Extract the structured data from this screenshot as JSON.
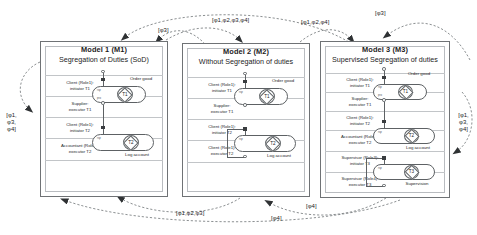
{
  "diagram": {
    "arrow_color": "#2f3234",
    "box_border_color": "#6f7275"
  },
  "models": [
    {
      "id": "M1",
      "title": "Model 1 (M1)",
      "subtitle": "Segregation of Duties (SoD)",
      "bands": [
        {
          "role": "Client (Role1):",
          "line2": "initiator T1"
        },
        {
          "role": "Supplier:",
          "line2": "executor T1"
        },
        {
          "role": "Client (Role1):",
          "line2": "initiator T2"
        },
        {
          "role": "Accountant (Role2):",
          "line2": "executor T2"
        }
      ],
      "transactions": [
        {
          "id": "T1",
          "label": "Order good"
        },
        {
          "id": "T2",
          "label": "Log account"
        }
      ]
    },
    {
      "id": "M2",
      "title": "Model 2 (M2)",
      "subtitle": "Without Segregation of duties",
      "bands": [
        {
          "role": "Client (Role1):",
          "line2": "initiator T1"
        },
        {
          "role": "Supplier:",
          "line2": "executor T1"
        },
        {
          "role": "Client (Role1):",
          "line2": "initiator T2"
        },
        {
          "role": "Client (Role1):",
          "line2": "executor T2"
        }
      ],
      "transactions": [
        {
          "id": "T1",
          "label": "Order good"
        },
        {
          "id": "T2",
          "label": "Log account"
        }
      ]
    },
    {
      "id": "M3",
      "title": "Model 3 (M3)",
      "subtitle": "Supervised Segregation of duties",
      "bands": [
        {
          "role": "Client (Role1):",
          "line2": "initiator T1"
        },
        {
          "role": "Supplier:",
          "line2": "executor T1"
        },
        {
          "role": "Client (Role1):",
          "line2": "initiator T2"
        },
        {
          "role": "Accountant (Role2):",
          "line2": "executor T2"
        },
        {
          "role": "Supervisor (Role3):",
          "line2": "initiator T3"
        },
        {
          "role": "Supervisor (Role4):",
          "line2": "executor T3"
        }
      ],
      "transactions": [
        {
          "id": "T1",
          "label": "Order good"
        },
        {
          "id": "T2",
          "label": "Log account"
        },
        {
          "id": "T3",
          "label": "Supervision"
        }
      ]
    }
  ],
  "arc_labels": {
    "top_left_phi3": "[φ3]",
    "top_mid_all": "[φ1,φ2,φ3,φ4]",
    "top_right_124": "[φ1,φ2,φ4]",
    "top_far_phi3": "[φ3]",
    "left_stack": "[φ1, φ3, φ4]",
    "right_stack": "[φ1, φ3, φ4]",
    "bottom_123": "[φ1,φ2,φ3]",
    "bottom_phi4_mid": "[φ4]",
    "bottom_phi4_right": "[φ4]"
  },
  "markers": {
    "initiator": "filled-square",
    "executor": "hollow-circle",
    "transaction_kind": "diamond-in-circle"
  }
}
